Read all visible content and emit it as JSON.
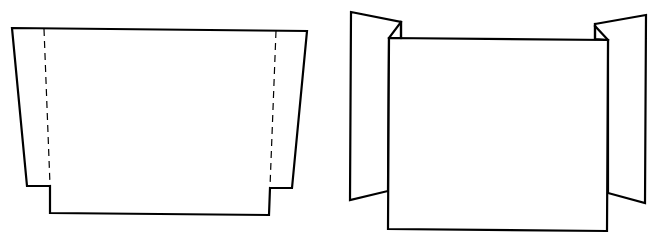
{
  "figure": {
    "colors": {
      "line": "#000000",
      "background": "#ffffff"
    },
    "panels": [
      {
        "id": "flat-template",
        "description": "Unfolded flat template: center panel with two side flaps separated by dashed fold lines",
        "outline_points": "12,28 307,31 292,188 270,188 269,215 50,213 50,186 27,186",
        "fold_lines": [
          {
            "x1": 44,
            "y1": 29,
            "x2": 50,
            "y2": 185
          },
          {
            "x1": 276,
            "y1": 31,
            "x2": 270,
            "y2": 187
          }
        ]
      },
      {
        "id": "folded-standing",
        "description": "Folded template standing upright with side flaps angled back",
        "left_flap_points": "351,12 401,22 401,38 389,38 388,191 350,200",
        "right_flap_points": "595,24 646,15 645,203 608,193 608,40 595,39",
        "front_panel_points": "389,38 608,40 607,231 388,229",
        "left_fold_edges": [
          {
            "x1": 389,
            "y1": 38,
            "x2": 401,
            "y2": 22
          },
          {
            "x1": 401,
            "y1": 22,
            "x2": 401,
            "y2": 38
          }
        ],
        "right_fold_edges": [
          {
            "x1": 595,
            "y1": 26,
            "x2": 608,
            "y2": 40
          },
          {
            "x1": 595,
            "y1": 24,
            "x2": 595,
            "y2": 39
          }
        ]
      }
    ]
  }
}
